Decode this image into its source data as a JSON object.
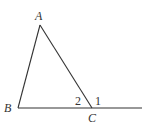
{
  "figure": {
    "type": "triangle-with-exterior-angle",
    "stroke_color": "#333333",
    "vertices": {
      "A": {
        "label": "A",
        "x": 40,
        "y": 25
      },
      "B": {
        "label": "B",
        "x": 18,
        "y": 108
      },
      "C": {
        "label": "C",
        "x": 92,
        "y": 108
      }
    },
    "extension_end": {
      "x": 142,
      "y": 108
    },
    "angle_labels": {
      "interior_C": "2",
      "exterior_C": "1"
    }
  }
}
